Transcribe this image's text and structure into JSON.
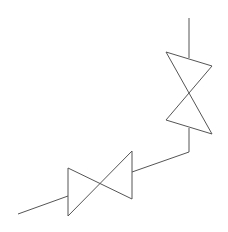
{
  "diagram": {
    "type": "piping-isometric",
    "stroke_color": "#555555",
    "background": "#ffffff",
    "elements": [
      {
        "id": "pipe-top",
        "kind": "pipe",
        "points": "189,18 189,58"
      },
      {
        "id": "valve-upper",
        "kind": "gate-valve",
        "points": "166,52 212,66 166,120 212,134 166,52"
      },
      {
        "id": "pipe-connector",
        "kind": "pipe",
        "points": "189,128 189,152 132,172"
      },
      {
        "id": "valve-lower",
        "kind": "gate-valve",
        "points": "132,151 132,199 68,168 68,216 132,151"
      },
      {
        "id": "pipe-left",
        "kind": "pipe",
        "points": "18,214 68,196"
      }
    ]
  }
}
